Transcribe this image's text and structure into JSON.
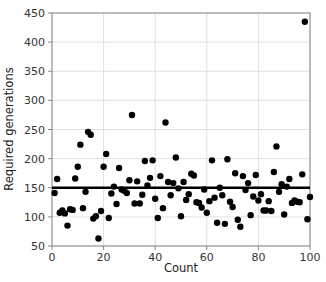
{
  "chart_data": {
    "type": "scatter",
    "title": "",
    "xlabel": "Count",
    "ylabel": "Required generations",
    "xlim": [
      0,
      100
    ],
    "ylim": [
      50,
      450
    ],
    "xticks": [
      0,
      20,
      40,
      60,
      80,
      100
    ],
    "yticks": [
      50,
      100,
      150,
      200,
      250,
      300,
      350,
      400,
      450
    ],
    "xtick_labels": [
      "0",
      "20",
      "40",
      "60",
      "80",
      "100"
    ],
    "ytick_labels": [
      "50",
      "100",
      "150",
      "200",
      "250",
      "300",
      "350",
      "400",
      "450"
    ],
    "grid": true,
    "grid_color": "#d8d8d8",
    "legend": null,
    "marker_color": "#000000",
    "marker_size": 3.2,
    "trend_line": {
      "type": "horizontal-mean-line",
      "value": 150,
      "color": "#000000",
      "width": 2.6,
      "x_start": 0,
      "x_end": 100
    },
    "series": [
      {
        "name": "Required generations",
        "points": [
          [
            1,
            141
          ],
          [
            2,
            165
          ],
          [
            3,
            107
          ],
          [
            4,
            111
          ],
          [
            5,
            106
          ],
          [
            6,
            85
          ],
          [
            7,
            113
          ],
          [
            8,
            112
          ],
          [
            9,
            166
          ],
          [
            10,
            186
          ],
          [
            11,
            224
          ],
          [
            12,
            115
          ],
          [
            13,
            143
          ],
          [
            14,
            246
          ],
          [
            15,
            241
          ],
          [
            16,
            97
          ],
          [
            17,
            101
          ],
          [
            18,
            63
          ],
          [
            19,
            110
          ],
          [
            20,
            186
          ],
          [
            21,
            208
          ],
          [
            22,
            98
          ],
          [
            23,
            140
          ],
          [
            24,
            152
          ],
          [
            25,
            122
          ],
          [
            26,
            184
          ],
          [
            27,
            147
          ],
          [
            28,
            145
          ],
          [
            29,
            141
          ],
          [
            30,
            163
          ],
          [
            31,
            275
          ],
          [
            32,
            123
          ],
          [
            33,
            161
          ],
          [
            34,
            123
          ],
          [
            35,
            138
          ],
          [
            36,
            196
          ],
          [
            37,
            154
          ],
          [
            38,
            167
          ],
          [
            39,
            197
          ],
          [
            40,
            131
          ],
          [
            41,
            98
          ],
          [
            42,
            170
          ],
          [
            43,
            115
          ],
          [
            44,
            262
          ],
          [
            45,
            160
          ],
          [
            46,
            137
          ],
          [
            47,
            158
          ],
          [
            48,
            202
          ],
          [
            49,
            149
          ],
          [
            50,
            101
          ],
          [
            51,
            160
          ],
          [
            52,
            129
          ],
          [
            53,
            139
          ],
          [
            54,
            174
          ],
          [
            55,
            171
          ],
          [
            56,
            125
          ],
          [
            57,
            124
          ],
          [
            58,
            116
          ],
          [
            59,
            147
          ],
          [
            60,
            107
          ],
          [
            61,
            127
          ],
          [
            62,
            197
          ],
          [
            63,
            133
          ],
          [
            64,
            90
          ],
          [
            65,
            150
          ],
          [
            66,
            137
          ],
          [
            67,
            88
          ],
          [
            68,
            199
          ],
          [
            69,
            126
          ],
          [
            70,
            117
          ],
          [
            71,
            175
          ],
          [
            72,
            95
          ],
          [
            73,
            83
          ],
          [
            74,
            170
          ],
          [
            75,
            146
          ],
          [
            76,
            158
          ],
          [
            77,
            103
          ],
          [
            78,
            135
          ],
          [
            79,
            172
          ],
          [
            80,
            128
          ],
          [
            81,
            139
          ],
          [
            82,
            111
          ],
          [
            83,
            111
          ],
          [
            84,
            127
          ],
          [
            85,
            110
          ],
          [
            86,
            177
          ],
          [
            87,
            221
          ],
          [
            88,
            143
          ],
          [
            89,
            156
          ],
          [
            90,
            104
          ],
          [
            91,
            152
          ],
          [
            92,
            165
          ],
          [
            93,
            124
          ],
          [
            94,
            128
          ],
          [
            95,
            126
          ],
          [
            96,
            125
          ],
          [
            97,
            173
          ],
          [
            98,
            435
          ],
          [
            99,
            96
          ],
          [
            100,
            134
          ]
        ]
      }
    ]
  },
  "axes": {
    "x_title": "Count",
    "y_title": "Required generations"
  }
}
